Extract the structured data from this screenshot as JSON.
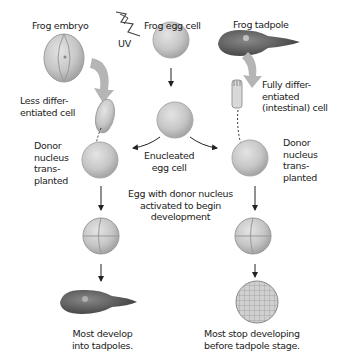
{
  "diagram": {
    "columns": {
      "left": {
        "source_label": "Frog embryo",
        "donor_cell_label": "Less differ-\nentiated cell",
        "transplant_label": "Donor\nnucleus\ntrans-\nplanted",
        "outcome_label": "Most develop\ninto tadpoles."
      },
      "center": {
        "source_label": "Frog egg cell",
        "uv_label": "UV",
        "enucleated_label": "Enucleated\negg cell",
        "activation_label": "Egg with donor nucleus\nactivated to begin\ndevelopment"
      },
      "right": {
        "source_label": "Frog tadpole",
        "donor_cell_label": "Fully differ-\nentiated\n(intestinal) cell",
        "transplant_label": "Donor\nnucleus\ntrans-\nplanted",
        "outcome_label": "Most stop developing\nbefore tadpole stage."
      }
    },
    "colors": {
      "egg_fill": "#c8c8c8",
      "egg_stroke": "#a8a8a8",
      "arrow": "#222222",
      "big_arrow": "#b5b5b5",
      "tadpole": "#5a5a5a"
    }
  }
}
